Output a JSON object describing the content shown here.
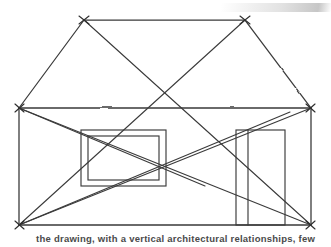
{
  "image": {
    "width": 331,
    "height": 247,
    "background_color": "#ffffff",
    "ink_color": "#3a3a3a",
    "subject": "hand-drawn elevation of a house with diagonal corner-to-corner relationship lines"
  },
  "caption": {
    "text": "the drawing, with a vertical architectural relationships, few"
  },
  "sketch": {
    "title": "house-elevation-sketch",
    "elements": [
      {
        "name": "roof-ridge",
        "type": "line",
        "points": "84,20 245,20"
      },
      {
        "name": "roof-left-slope",
        "type": "line",
        "points": "84,20 19,108"
      },
      {
        "name": "roof-right-slope",
        "type": "line",
        "points": "245,20 311,108"
      },
      {
        "name": "eave-line",
        "type": "line",
        "points": "19,108 311,108"
      },
      {
        "name": "wall-left",
        "type": "line",
        "points": "19,108 19,225"
      },
      {
        "name": "wall-right",
        "type": "line",
        "points": "311,108 311,225"
      },
      {
        "name": "baseline",
        "type": "line",
        "points": "19,225 311,225"
      },
      {
        "name": "window-rect",
        "type": "rect",
        "x": 81,
        "y": 130,
        "width": 85,
        "height": 56
      },
      {
        "name": "window-inner-rect",
        "type": "rect",
        "x": 88,
        "y": 136,
        "width": 71,
        "height": 44
      },
      {
        "name": "door-rect",
        "type": "rect",
        "x": 236,
        "y": 130,
        "width": 49,
        "height": 95
      },
      {
        "name": "door-inner-line",
        "type": "line",
        "points": "248,130 248,225"
      },
      {
        "name": "diagonal-apex-left-to-corner-right",
        "type": "line",
        "points": "84,20 311,225"
      },
      {
        "name": "diagonal-apex-right-to-corner-left",
        "type": "line",
        "points": "245,20 19,225"
      },
      {
        "name": "diagonal-eave-left-to-corner-right",
        "type": "line",
        "points": "19,108 311,225"
      },
      {
        "name": "diagonal-eave-right-to-corner-left",
        "type": "line",
        "points": "311,108 19,225"
      },
      {
        "name": "diagonal-eave-left-to-window-right",
        "type": "line",
        "points": "19,108 205,186"
      },
      {
        "name": "diagonal-corner-left-to-eave-right",
        "type": "line",
        "points": "19,225 290,112"
      }
    ],
    "vertex_marks": [
      {
        "name": "vertex-mark-roof-apex-left",
        "x": 84,
        "y": 20
      },
      {
        "name": "vertex-mark-roof-apex-right",
        "x": 245,
        "y": 20
      },
      {
        "name": "vertex-mark-eave-left",
        "x": 19,
        "y": 108
      },
      {
        "name": "vertex-mark-eave-right",
        "x": 311,
        "y": 108
      },
      {
        "name": "vertex-mark-base-left",
        "x": 19,
        "y": 225
      },
      {
        "name": "vertex-mark-base-right",
        "x": 311,
        "y": 225
      }
    ]
  }
}
